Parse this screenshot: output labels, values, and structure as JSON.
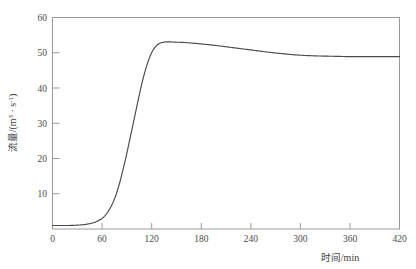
{
  "chart_data": {
    "type": "line",
    "title": "",
    "xlabel": "时间/min",
    "ylabel": "流量/(m³ · s⁻¹)",
    "ylabel_parts": {
      "name": "流量",
      "slash": "/(m",
      "exp1": "3",
      "middot": " · s",
      "exp2": "-1",
      "close": ")"
    },
    "xlabel_parts": {
      "name": "时间",
      "unit": "/min"
    },
    "xlim": [
      0,
      420
    ],
    "ylim": [
      0,
      60
    ],
    "xticks": [
      0,
      60,
      120,
      180,
      240,
      300,
      360,
      420
    ],
    "xtick_labels": [
      "0",
      "60",
      "120",
      "180",
      "240",
      "300",
      "360",
      "420"
    ],
    "yticks": [
      10,
      20,
      30,
      40,
      50,
      60
    ],
    "ytick_labels": [
      "10",
      "20",
      "30",
      "40",
      "50",
      "60"
    ],
    "grid": false,
    "legend": null,
    "series": [
      {
        "name": "流量",
        "color": "#4a4a4a",
        "x": [
          0,
          10,
          20,
          30,
          40,
          50,
          55,
          60,
          65,
          70,
          75,
          80,
          85,
          90,
          95,
          100,
          105,
          110,
          115,
          120,
          125,
          130,
          135,
          140,
          150,
          160,
          180,
          200,
          220,
          240,
          260,
          280,
          300,
          320,
          340,
          360,
          380,
          400,
          420
        ],
        "y": [
          1.0,
          1.0,
          1.0,
          1.1,
          1.3,
          1.8,
          2.3,
          3.0,
          4.2,
          6.0,
          8.5,
          12.0,
          16.5,
          21.5,
          27.0,
          32.5,
          38.0,
          43.0,
          47.0,
          50.0,
          51.8,
          52.7,
          53.0,
          53.1,
          53.0,
          52.9,
          52.5,
          52.0,
          51.4,
          50.8,
          50.2,
          49.7,
          49.3,
          49.1,
          49.0,
          48.9,
          48.9,
          48.9,
          48.9
        ]
      }
    ],
    "peak_value": 53.1,
    "peak_time": 140,
    "plateau_value": 48.9,
    "baseline_value": 1.0
  },
  "figure": {
    "background_color": "#ffffff",
    "frame_color": "#9a9a9a",
    "line_color": "#4a4a4a"
  }
}
